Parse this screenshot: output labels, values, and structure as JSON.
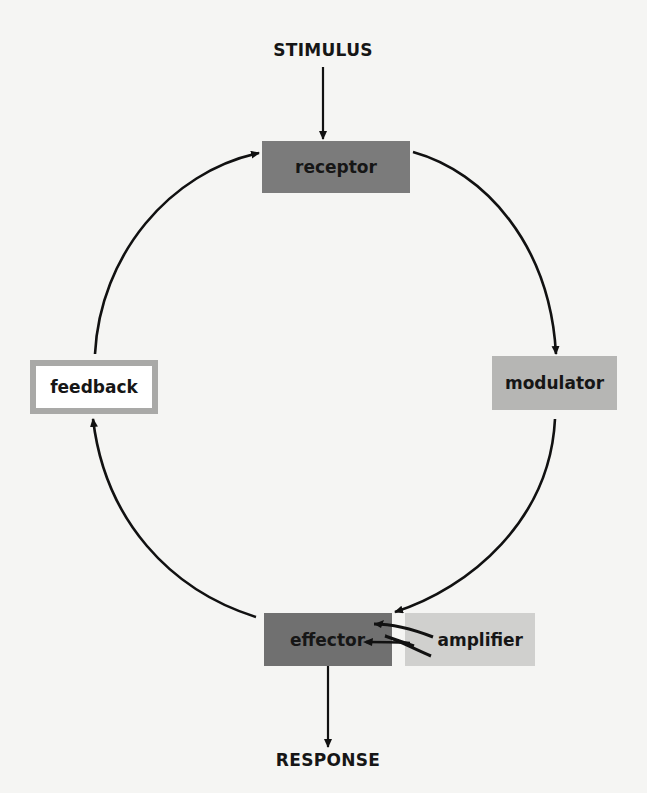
{
  "diagram": {
    "input_label": "STIMULUS",
    "output_label": "RESPONSE",
    "nodes": {
      "receptor": {
        "label": "receptor",
        "fill": "#7b7b7b"
      },
      "modulator": {
        "label": "modulator",
        "fill": "#b6b6b4"
      },
      "effector": {
        "label": "effector",
        "fill": "#707070"
      },
      "amplifier": {
        "label": "amplifier",
        "fill": "#d0d0ce"
      },
      "feedback": {
        "label": "feedback",
        "fill": "#ffffff",
        "border": "#a9a9a7"
      }
    },
    "edges": [
      {
        "from": "STIMULUS",
        "to": "receptor"
      },
      {
        "from": "receptor",
        "to": "modulator"
      },
      {
        "from": "modulator",
        "to": "effector"
      },
      {
        "from": "amplifier",
        "to": "effector"
      },
      {
        "from": "effector",
        "to": "RESPONSE"
      },
      {
        "from": "effector",
        "to": "feedback"
      },
      {
        "from": "feedback",
        "to": "receptor"
      }
    ]
  }
}
